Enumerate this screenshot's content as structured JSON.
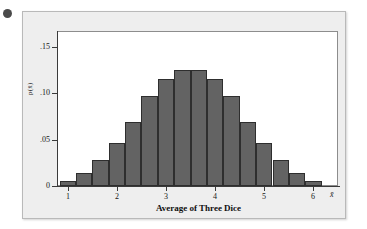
{
  "figure": {
    "bullet_marker": "•",
    "panel_background": "#eeeeee",
    "bar_fill_color": "#636363",
    "bar_edge_color": "#2e2e2e"
  },
  "chart_data": {
    "type": "bar",
    "title": "",
    "subtitle": "",
    "xlabel": "Average of Three Dice",
    "ylabel": "p(x̄)",
    "x_axis_end_symbol": "x̄",
    "grid": false,
    "legend": null,
    "xlim": [
      0.78,
      6.5
    ],
    "ylim": [
      0,
      0.1675
    ],
    "xtick_labels": [
      "1",
      "2",
      "3",
      "4",
      "5",
      "6"
    ],
    "xtick_values": [
      1,
      2,
      3,
      4,
      5,
      6
    ],
    "ytick_labels": [
      "0",
      ".05",
      ".10",
      ".15"
    ],
    "ytick_values": [
      0,
      0.05,
      0.1,
      0.15
    ],
    "bin_width": 0.3333,
    "categories": [
      "1.00",
      "1.33",
      "1.67",
      "2.00",
      "2.33",
      "2.67",
      "3.00",
      "3.33",
      "3.67",
      "4.00",
      "4.33",
      "4.67",
      "5.00",
      "5.33",
      "5.67",
      "6.00"
    ],
    "bin_left_edges": [
      0.833,
      1.167,
      1.5,
      1.833,
      2.167,
      2.5,
      2.833,
      3.167,
      3.5,
      3.833,
      4.167,
      4.5,
      4.833,
      5.167,
      5.5,
      5.833
    ],
    "values": [
      0.005,
      0.014,
      0.028,
      0.046,
      0.069,
      0.097,
      0.1155,
      0.125,
      0.125,
      0.1155,
      0.097,
      0.069,
      0.046,
      0.028,
      0.014,
      0.005
    ]
  }
}
